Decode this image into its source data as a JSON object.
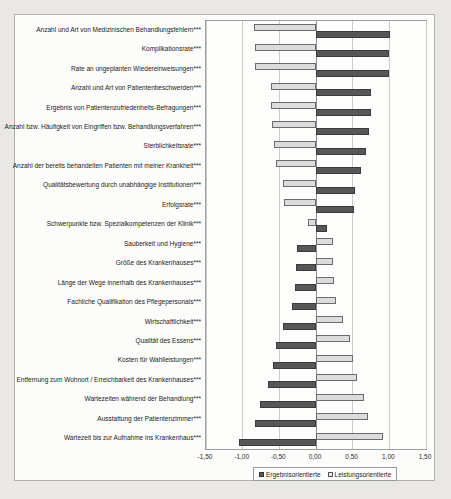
{
  "chart_data": {
    "type": "bar",
    "orientation": "horizontal",
    "title": "",
    "xlabel": "",
    "ylabel": "",
    "xlim": [
      -1.5,
      1.5
    ],
    "grid": "vertical",
    "legend_position": "bottom",
    "x_ticks": [
      "-1,50",
      "-1,00",
      "-0,50",
      "0,00",
      "0,50",
      "1,00",
      "1,50"
    ],
    "x_tick_values": [
      -1.5,
      -1.0,
      -0.5,
      0.0,
      0.5,
      1.0,
      1.5
    ],
    "categories": [
      "Anzahl und Art von Medizinischen Behandlungsfehlern***",
      "Komplikationsrate***",
      "Rate an ungeplanten Wiedereinweisungen***",
      "Anzahl und Art von Patientenbeschwerden***",
      "Ergebnis von Patientenzufriedenheits-Befragungen***",
      "Anzahl bzw. Häufigkeit von Eingriffen bzw. Behandlungsverfahren***",
      "Sterblichkeitsrate***",
      "Anzahl der bereits behandelten Patienten mit meiner Krankheit***",
      "Qualitätsbewertung durch unabhängige Institutionen***",
      "Erfolgsrate***",
      "Schwerpunkte bzw. Spezialkompetenzen der Klinik***",
      "Sauberkeit und Hygiene***",
      "Größe des Krankenhauses***",
      "Länge der Wege innerhalb des Krankenhauses***",
      "Fachliche Qualifikation des Pflegepersonals***",
      "Wirtschaftlichkeit***",
      "Qualität des Essens***",
      "Kosten für Wahlleistungen***",
      "Entfernung zum Wohnort / Erreichbarkeit des Krankenhauses***",
      "Wartezeiten während der Behandlung***",
      "Ausstattung der Patientenzimmer***",
      "Wartezeit bis zur Aufnahme ins Krankenhaus***"
    ],
    "series": [
      {
        "name": "Ergebnisorientierte",
        "color": "#575757",
        "values": [
          1.01,
          1.0,
          0.99,
          0.75,
          0.75,
          0.72,
          0.68,
          0.62,
          0.53,
          0.52,
          0.15,
          -0.26,
          -0.27,
          -0.29,
          -0.33,
          -0.45,
          -0.55,
          -0.59,
          -0.65,
          -0.77,
          -0.83,
          -1.05
        ]
      },
      {
        "name": "Leistungsorientierte",
        "color": "#dcdcdc",
        "values": [
          -0.84,
          -0.83,
          -0.83,
          -0.62,
          -0.61,
          -0.6,
          -0.57,
          -0.54,
          -0.45,
          -0.44,
          -0.11,
          0.23,
          0.23,
          0.24,
          0.27,
          0.37,
          0.47,
          0.5,
          0.56,
          0.65,
          0.71,
          0.91
        ]
      }
    ]
  }
}
